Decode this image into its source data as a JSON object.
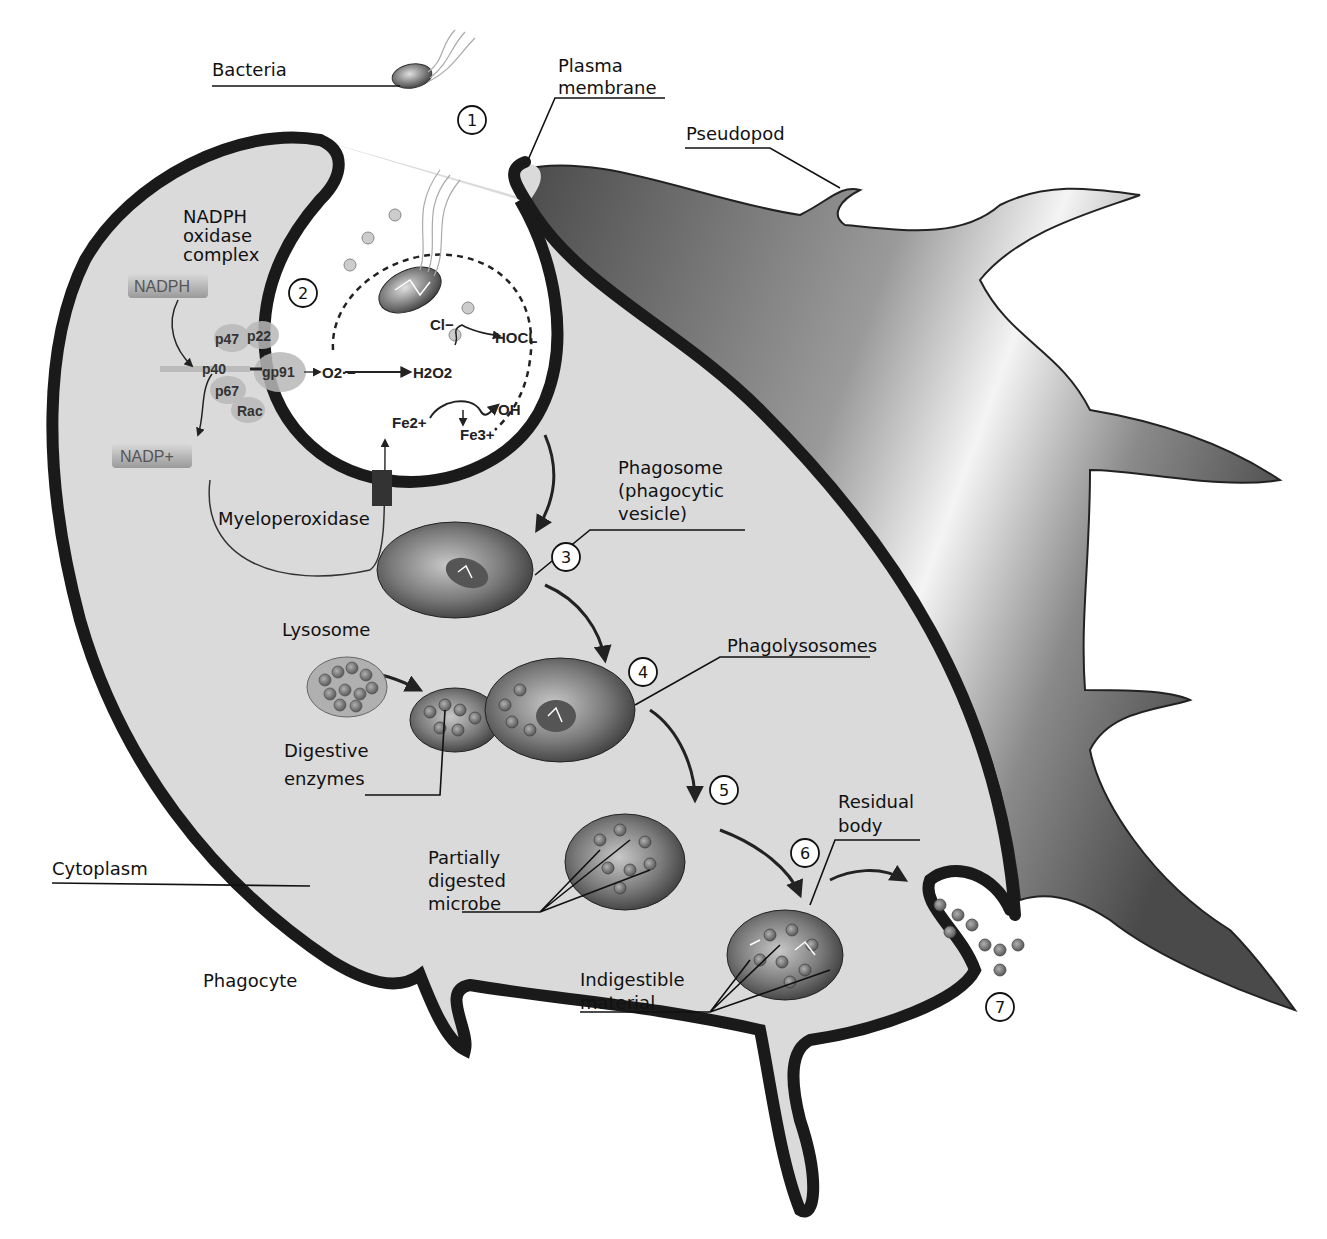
{
  "labels": {
    "bacteria": "Bacteria",
    "plasma_membrane_1": "Plasma",
    "plasma_membrane_2": "membrane",
    "pseudopod": "Pseudopod",
    "nadph_oxidase_1": "NADPH",
    "nadph_oxidase_2": "oxidase",
    "nadph_oxidase_3": "complex",
    "myeloperoxidase": "Myeloperoxidase",
    "phagosome_1": "Phagosome",
    "phagosome_2": "(phagocytic",
    "phagosome_3": "vesicle)",
    "lysosome": "Lysosome",
    "phagolysosomes": "Phagolysosomes",
    "digestive_1": "Digestive",
    "digestive_2": "enzymes",
    "residual_1": "Residual",
    "residual_2": "body",
    "partially_1": "Partially",
    "partially_2": "digested",
    "partially_3": "microbe",
    "cytoplasm": "Cytoplasm",
    "phagocyte": "Phagocyte",
    "indigestible_1": "Indigestible",
    "indigestible_2": "material"
  },
  "chemistry": {
    "nadph": "NADPH",
    "nadp": "NADP+",
    "p47": "p47",
    "p22": "p22",
    "p40": "p40",
    "gp91": "gp91",
    "p67": "p67",
    "rac": "Rac",
    "o2": "O2·−",
    "h2o2": "H2O2",
    "cl": "Cl−",
    "hocl": "HOCL",
    "fe2": "Fe2+",
    "fe3": "Fe3+",
    "oh": "OH"
  },
  "steps": [
    "1",
    "2",
    "3",
    "4",
    "5",
    "6",
    "7"
  ],
  "colors": {
    "membrane": "#1a1a1a",
    "cytoplasm": "#d9d9d9",
    "pseudopod_dark": "#555555",
    "vesicle": "#6a6a6a",
    "granule": "#8a8a8a"
  }
}
